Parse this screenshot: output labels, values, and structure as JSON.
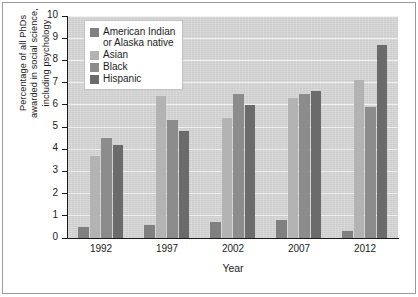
{
  "chart_data": {
    "type": "bar",
    "title": "",
    "xlabel": "Year",
    "ylabel": "Percentage of all PhDs\nawarded in social science,\nincluding psychology",
    "categories": [
      "1992",
      "1997",
      "2002",
      "2007",
      "2012"
    ],
    "ylim": [
      0,
      10
    ],
    "yticks": [
      "0",
      "1",
      "2",
      "3",
      "4",
      "5",
      "6",
      "7",
      "8",
      "9",
      "10"
    ],
    "grid": true,
    "legend_position": "upper-left-inside",
    "series": [
      {
        "name": "American Indian\nor Alaska native",
        "color": "#808080",
        "values": [
          0.5,
          0.6,
          0.7,
          0.8,
          0.3
        ]
      },
      {
        "name": "Asian",
        "color": "#b3b3b3",
        "values": [
          3.7,
          6.4,
          5.4,
          6.3,
          7.1
        ]
      },
      {
        "name": "Black",
        "color": "#8c8c8c",
        "values": [
          4.5,
          5.3,
          6.5,
          6.5,
          5.9
        ]
      },
      {
        "name": "Hispanic",
        "color": "#6b6b6b",
        "values": [
          4.2,
          4.8,
          6.0,
          6.6,
          8.7
        ]
      }
    ]
  },
  "style": {
    "plot_background": "#d7d7d7",
    "gridline_color": "#f0f0f0",
    "axis_color": "#1b1b1b",
    "frame_color": "#9a9a9a",
    "page_background": "#ffffff"
  }
}
